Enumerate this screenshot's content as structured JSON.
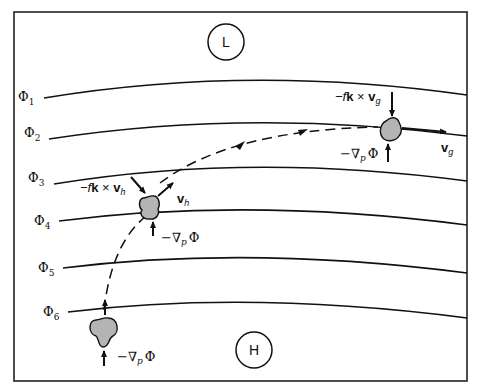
{
  "diagram": {
    "pressure_centers": {
      "low": {
        "label": "L"
      },
      "high": {
        "label": "H"
      }
    },
    "contours": [
      {
        "symbol": "Φ",
        "subscript": "1"
      },
      {
        "symbol": "Φ",
        "subscript": "2"
      },
      {
        "symbol": "Φ",
        "subscript": "3"
      },
      {
        "symbol": "Φ",
        "subscript": "4"
      },
      {
        "symbol": "Φ",
        "subscript": "5"
      },
      {
        "symbol": "Φ",
        "subscript": "6"
      }
    ],
    "parcels": {
      "initial": {
        "pgf_label": {
          "prefix": "−∇",
          "sub": "p",
          "suffix": "Φ"
        }
      },
      "middle": {
        "coriolis_label": {
          "prefix": "−f",
          "bold": "k",
          "times": " × ",
          "vec": "v",
          "sub": "h"
        },
        "velocity_label": {
          "vec": "v",
          "sub": "h"
        },
        "pgf_label": {
          "prefix": "−∇",
          "sub": "p",
          "suffix": "Φ"
        }
      },
      "final": {
        "coriolis_label": {
          "prefix": "−f",
          "bold": "k",
          "times": " × ",
          "vec": "v",
          "sub": "g"
        },
        "velocity_label": {
          "vec": "v",
          "sub": "g"
        },
        "pgf_label": {
          "prefix": "−∇",
          "sub": "p",
          "suffix": "Φ"
        }
      }
    },
    "colors": {
      "line": "#111111",
      "parcel_fill": "#b4b4b4",
      "background": "#ffffff"
    }
  }
}
